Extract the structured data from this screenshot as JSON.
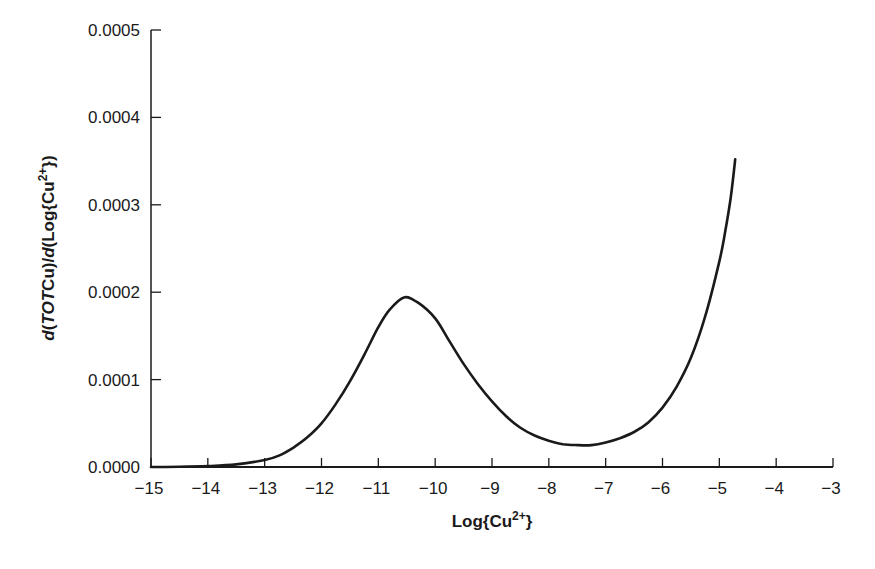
{
  "chart_data": {
    "type": "line",
    "title": "",
    "xlabel": "Log{Cu2+}",
    "xlabel_parts": {
      "base": "Log{Cu",
      "sup": "2+",
      "end": "}"
    },
    "ylabel": "d(TOTCu)/d(Log{Cu2+})",
    "ylabel_parts": {
      "d1": "d",
      "p1": "(",
      "tot": "TOT",
      "cu": "Cu)/",
      "d2": "d",
      "rest": "(Log{Cu",
      "sup": "2+",
      "end": "})"
    },
    "xlim": [
      -15,
      -3
    ],
    "ylim": [
      0,
      0.0005
    ],
    "grid": false,
    "legend": null,
    "x_ticks": [
      -15,
      -14,
      -13,
      -12,
      -11,
      -10,
      -9,
      -8,
      -7,
      -6,
      -5,
      -4,
      -3
    ],
    "x_tick_labels": [
      "−15",
      "−14",
      "−13",
      "−12",
      "−11",
      "−10",
      "−9",
      "−8",
      "−7",
      "−6",
      "−5",
      "−4",
      "−3"
    ],
    "y_ticks": [
      0,
      0.0001,
      0.0002,
      0.0003,
      0.0004,
      0.0005
    ],
    "y_tick_labels": [
      "0.0000",
      "0.0001",
      "0.0002",
      "0.0003",
      "0.0004",
      "0.0005"
    ],
    "series": [
      {
        "name": "d(TOTCu)/d(Log{Cu2+})",
        "color": "#1a1a1a",
        "x": [
          -15,
          -14.5,
          -14,
          -13.5,
          -13,
          -12.75,
          -12.5,
          -12.25,
          -12,
          -11.75,
          -11.5,
          -11.25,
          -11,
          -10.8,
          -10.55,
          -10.3,
          -10,
          -9.75,
          -9.5,
          -9.25,
          -9,
          -8.75,
          -8.5,
          -8.25,
          -8,
          -7.75,
          -7.5,
          -7.25,
          -7,
          -6.75,
          -6.5,
          -6.25,
          -6,
          -5.75,
          -5.5,
          -5.25,
          -5,
          -4.9,
          -4.8,
          -4.72
        ],
        "y": [
          0.0,
          3e-07,
          1e-06,
          3e-06,
          8e-06,
          1.3e-05,
          2.2e-05,
          3.4e-05,
          5e-05,
          7.2e-05,
          9.8e-05,
          0.000128,
          0.00016,
          0.00018,
          0.000194,
          0.000188,
          0.00017,
          0.000144,
          0.000118,
          9.5e-05,
          7.5e-05,
          5.8e-05,
          4.5e-05,
          3.6e-05,
          3e-05,
          2.6e-05,
          2.5e-05,
          2.5e-05,
          2.8e-05,
          3.3e-05,
          4e-05,
          5.1e-05,
          6.8e-05,
          9.2e-05,
          0.000125,
          0.000172,
          0.000235,
          0.000268,
          0.000308,
          0.000352
        ]
      }
    ]
  }
}
